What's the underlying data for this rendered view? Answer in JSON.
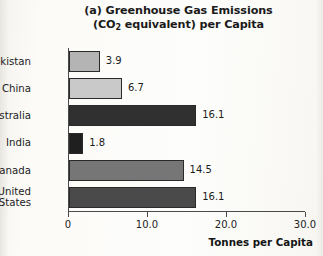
{
  "figure": {
    "title_line1": "(a) Greenhouse Gas Emissions",
    "title_line2_pre": "(CO",
    "title_line2_sub": "2",
    "title_line2_post": " equivalent) per Capita"
  },
  "chart_data": {
    "type": "bar",
    "orientation": "horizontal",
    "title": "(a) Greenhouse Gas Emissions (CO2 equivalent) per Capita",
    "xlabel": "Tonnes per Capita",
    "ylabel": "",
    "xlim": [
      0,
      30
    ],
    "xticks": [
      0,
      10,
      20,
      30
    ],
    "xtick_labels": [
      "0",
      "10.0",
      "20.0",
      "30.0"
    ],
    "grid": false,
    "legend": false,
    "categories": [
      "Uzbekistan",
      "China",
      "Australia",
      "India",
      "Canada",
      "United\nStates"
    ],
    "values": [
      3.9,
      6.7,
      16.1,
      1.8,
      14.5,
      16.1
    ],
    "value_labels": [
      "3.9",
      "6.7",
      "16.1",
      "1.8",
      "14.5",
      "16.1"
    ],
    "bar_colors": [
      "#b4b4b4",
      "#c9c9c9",
      "#303030",
      "#1f1f1f",
      "#767676",
      "#4a4a4a"
    ],
    "bar_edge_color": "#2a2a2a"
  }
}
